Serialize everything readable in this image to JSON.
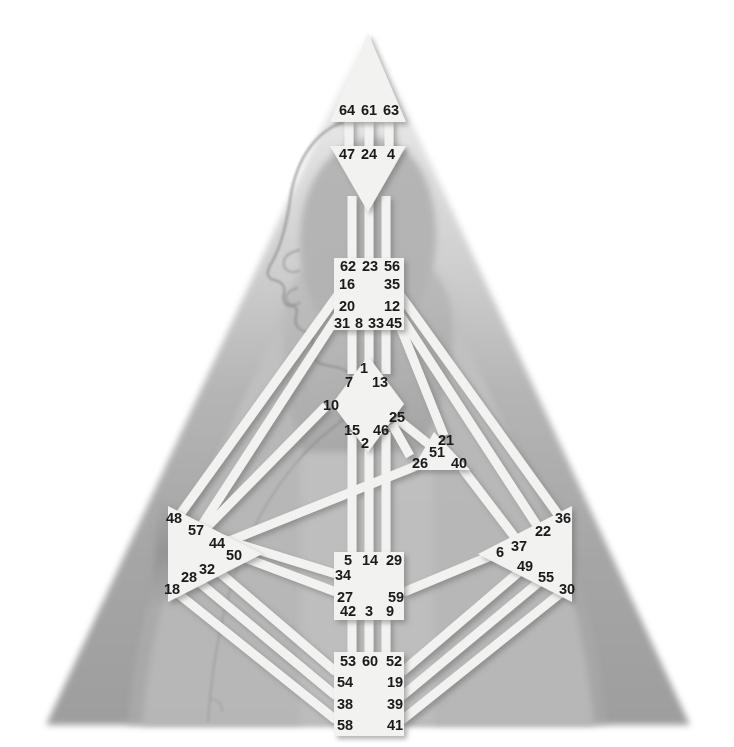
{
  "colors": {
    "background": "#ffffff",
    "triangle_upper": "#cfcfcf",
    "triangle_lower": "#a8a8a8",
    "triangle_aura_outer": "#c4c4c4",
    "head_silhouette": "#b9b9b9",
    "head_silhouette_dark": "#a3a3a3",
    "center_fill": "#f2f2f0",
    "channel_fill": "#f2f2f0",
    "gate_text": "#1a1a1a",
    "shadow": "#8e8e8e"
  },
  "figure": {
    "aura_triangle_label": "aura-triangle",
    "head_profile_label": "human-head-profile"
  },
  "centers": [
    {
      "id": "head",
      "name": "Head Center",
      "shape": "triangle-up",
      "gates": [
        {
          "num": "64",
          "x": 347,
          "y": 111
        },
        {
          "num": "61",
          "x": 369,
          "y": 111
        },
        {
          "num": "63",
          "x": 391,
          "y": 111
        }
      ]
    },
    {
      "id": "ajna",
      "name": "Ajna Center",
      "shape": "triangle-down",
      "gates": [
        {
          "num": "47",
          "x": 347,
          "y": 155
        },
        {
          "num": "24",
          "x": 369,
          "y": 155
        },
        {
          "num": "4",
          "x": 391,
          "y": 155
        }
      ]
    },
    {
      "id": "throat",
      "name": "Throat Center",
      "shape": "square",
      "gates": [
        {
          "num": "62",
          "x": 348,
          "y": 267
        },
        {
          "num": "23",
          "x": 370,
          "y": 267
        },
        {
          "num": "56",
          "x": 392,
          "y": 267
        },
        {
          "num": "16",
          "x": 347,
          "y": 285
        },
        {
          "num": "35",
          "x": 392,
          "y": 285
        },
        {
          "num": "20",
          "x": 347,
          "y": 307
        },
        {
          "num": "12",
          "x": 392,
          "y": 307
        },
        {
          "num": "31",
          "x": 342,
          "y": 324
        },
        {
          "num": "8",
          "x": 359,
          "y": 324
        },
        {
          "num": "33",
          "x": 376,
          "y": 324
        },
        {
          "num": "45",
          "x": 394,
          "y": 324
        }
      ]
    },
    {
      "id": "g-center",
      "name": "G Center",
      "shape": "diamond",
      "gates": [
        {
          "num": "1",
          "x": 364,
          "y": 369
        },
        {
          "num": "7",
          "x": 349,
          "y": 383
        },
        {
          "num": "13",
          "x": 380,
          "y": 383
        },
        {
          "num": "10",
          "x": 331,
          "y": 406
        },
        {
          "num": "25",
          "x": 397,
          "y": 418
        },
        {
          "num": "15",
          "x": 352,
          "y": 431
        },
        {
          "num": "46",
          "x": 381,
          "y": 431
        },
        {
          "num": "2",
          "x": 365,
          "y": 444
        }
      ]
    },
    {
      "id": "heart",
      "name": "Heart / Ego Center",
      "shape": "triangle-right-small",
      "gates": [
        {
          "num": "21",
          "x": 446,
          "y": 441
        },
        {
          "num": "51",
          "x": 437,
          "y": 453
        },
        {
          "num": "26",
          "x": 420,
          "y": 464
        },
        {
          "num": "40",
          "x": 459,
          "y": 464
        }
      ]
    },
    {
      "id": "spleen",
      "name": "Spleen Center",
      "shape": "triangle-right",
      "gates": [
        {
          "num": "48",
          "x": 174,
          "y": 519
        },
        {
          "num": "57",
          "x": 196,
          "y": 531
        },
        {
          "num": "44",
          "x": 217,
          "y": 544
        },
        {
          "num": "50",
          "x": 234,
          "y": 556
        },
        {
          "num": "32",
          "x": 207,
          "y": 570
        },
        {
          "num": "28",
          "x": 189,
          "y": 578
        },
        {
          "num": "18",
          "x": 172,
          "y": 590
        }
      ]
    },
    {
      "id": "solar-plexus",
      "name": "Solar Plexus Center",
      "shape": "triangle-left",
      "gates": [
        {
          "num": "36",
          "x": 563,
          "y": 519
        },
        {
          "num": "22",
          "x": 543,
          "y": 532
        },
        {
          "num": "37",
          "x": 519,
          "y": 547
        },
        {
          "num": "6",
          "x": 500,
          "y": 553
        },
        {
          "num": "49",
          "x": 525,
          "y": 567
        },
        {
          "num": "55",
          "x": 546,
          "y": 578
        },
        {
          "num": "30",
          "x": 567,
          "y": 590
        }
      ]
    },
    {
      "id": "sacral",
      "name": "Sacral Center",
      "shape": "square",
      "gates": [
        {
          "num": "5",
          "x": 348,
          "y": 561
        },
        {
          "num": "14",
          "x": 370,
          "y": 561
        },
        {
          "num": "29",
          "x": 394,
          "y": 561
        },
        {
          "num": "34",
          "x": 343,
          "y": 576
        },
        {
          "num": "27",
          "x": 345,
          "y": 598
        },
        {
          "num": "59",
          "x": 396,
          "y": 598
        },
        {
          "num": "42",
          "x": 348,
          "y": 612
        },
        {
          "num": "3",
          "x": 369,
          "y": 612
        },
        {
          "num": "9",
          "x": 390,
          "y": 612
        }
      ]
    },
    {
      "id": "root",
      "name": "Root Center",
      "shape": "square",
      "gates": [
        {
          "num": "53",
          "x": 348,
          "y": 662
        },
        {
          "num": "60",
          "x": 370,
          "y": 662
        },
        {
          "num": "52",
          "x": 394,
          "y": 662
        },
        {
          "num": "54",
          "x": 345,
          "y": 683
        },
        {
          "num": "19",
          "x": 395,
          "y": 683
        },
        {
          "num": "38",
          "x": 345,
          "y": 705
        },
        {
          "num": "39",
          "x": 395,
          "y": 705
        },
        {
          "num": "58",
          "x": 345,
          "y": 726
        },
        {
          "num": "41",
          "x": 395,
          "y": 726
        }
      ]
    }
  ]
}
